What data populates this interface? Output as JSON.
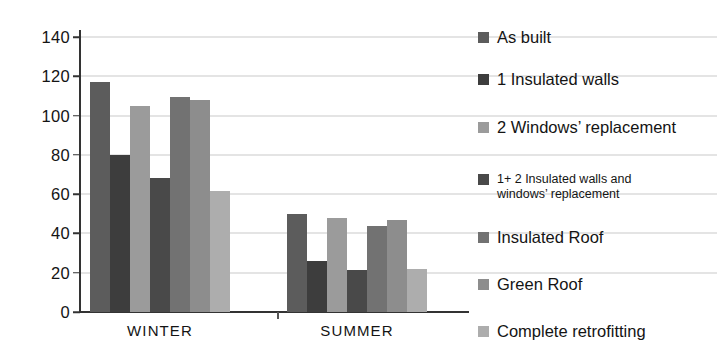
{
  "chart_data": {
    "type": "bar",
    "title": "",
    "subtitle": "",
    "xlabel": "",
    "ylabel": "",
    "categories": [
      "WINTER",
      "SUMMER"
    ],
    "ylim": [
      0,
      140
    ],
    "yticks": [
      0,
      20,
      40,
      60,
      80,
      100,
      120,
      140
    ],
    "ytick_labels": [
      "0",
      "20",
      "40",
      "60",
      "80",
      "100",
      "120",
      "140"
    ],
    "grid": true,
    "grid_axis": "y",
    "legend_position": "right",
    "series": [
      {
        "name": "As built",
        "values": [
          117,
          50
        ],
        "color": "#5c5c5c"
      },
      {
        "name": "1 Insulated walls",
        "values": [
          80,
          26
        ],
        "color": "#3d3d3d"
      },
      {
        "name": "2 Windows’ replacement",
        "values": [
          105,
          48
        ],
        "color": "#9b9b9b"
      },
      {
        "name": "1+ 2 Insulated walls and\nwindows’ replacement",
        "values": [
          68,
          21.5
        ],
        "color": "#494949"
      },
      {
        "name": "Insulated Roof",
        "values": [
          109.5,
          44
        ],
        "color": "#727272"
      },
      {
        "name": "Green Roof",
        "values": [
          108,
          47
        ],
        "color": "#8d8d8d"
      },
      {
        "name": "Complete retrofitting",
        "values": [
          61.5,
          22
        ],
        "color": "#adadad"
      }
    ]
  },
  "legend": {
    "items": [
      {
        "label": "As built",
        "compact": false
      },
      {
        "label": "1 Insulated walls",
        "compact": false
      },
      {
        "label": "2 Windows’ replacement",
        "compact": false
      },
      {
        "label": "1+ 2 Insulated walls and\nwindows’ replacement",
        "compact": true
      },
      {
        "label": "Insulated Roof",
        "compact": false
      },
      {
        "label": "Green Roof",
        "compact": false
      },
      {
        "label": "Complete retrofitting",
        "compact": false
      }
    ]
  },
  "axes": {
    "y_tick_labels": [
      "140",
      "120",
      "100",
      "80",
      "60",
      "40",
      "20",
      "0"
    ],
    "x_tick_labels": [
      "WINTER",
      "SUMMER"
    ]
  }
}
